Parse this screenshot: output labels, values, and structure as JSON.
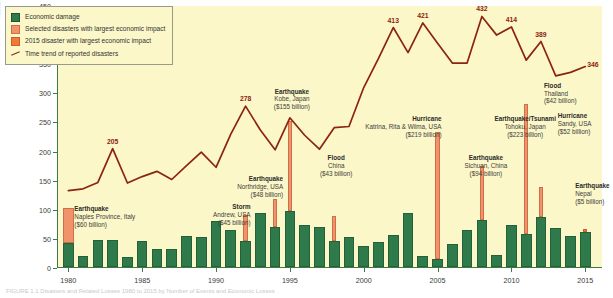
{
  "figure": {
    "caption": "FIGURE 1.1  Disasters and Related Losses 1980 to 2015 by Number of Events and Economic Losses"
  },
  "legend": {
    "items": [
      {
        "label": "Economic damage",
        "marker": "square",
        "color": "#2f7a4a"
      },
      {
        "label": "Selected disasters with largest economic impact",
        "marker": "square",
        "color": "#f0936a"
      },
      {
        "label": "2015 disaster with largest economic impact",
        "marker": "square",
        "color": "#f07838"
      },
      {
        "label": "Time trend of reported disasters",
        "marker": "line",
        "color": "#8b2410"
      }
    ]
  },
  "axes": {
    "y_label": "Number of disasters / Economic damage in 2015 US$ value (billion)",
    "y_ticks": [
      0,
      50,
      100,
      150,
      200,
      250,
      300,
      350,
      400,
      450
    ],
    "y_min": 0,
    "y_max": 450,
    "x_ticks": [
      1980,
      1985,
      1990,
      1995,
      2000,
      2005,
      2010,
      2015
    ],
    "x_min": 1979.3,
    "x_max": 2016.2
  },
  "chart_data": {
    "type": "bar",
    "title": "",
    "xlabel": "",
    "ylabel": "Number of disasters / Economic damage in 2015 US$ value (billion)",
    "ylim": [
      0,
      450
    ],
    "grid": false,
    "legend_position": "top-left",
    "categories": [
      1980,
      1981,
      1982,
      1983,
      1984,
      1985,
      1986,
      1987,
      1988,
      1989,
      1990,
      1991,
      1992,
      1993,
      1994,
      1995,
      1996,
      1997,
      1998,
      1999,
      2000,
      2001,
      2002,
      2003,
      2004,
      2005,
      2006,
      2007,
      2008,
      2009,
      2010,
      2011,
      2012,
      2013,
      2014,
      2015
    ],
    "series": [
      {
        "name": "Economic damage",
        "color": "#2f7a4a",
        "values": [
          42,
          19,
          47,
          47,
          18,
          45,
          31,
          31,
          54,
          51,
          79,
          63,
          44,
          92,
          68,
          96,
          73,
          68,
          45,
          52,
          36,
          43,
          55,
          92,
          19,
          13,
          39,
          63,
          80,
          21,
          72,
          57,
          86,
          67,
          53,
          60
        ]
      },
      {
        "name": "Selected disasters with largest economic impact",
        "color": "#f0936a",
        "values": [
          60,
          0,
          0,
          0,
          0,
          0,
          0,
          0,
          0,
          0,
          0,
          0,
          45,
          0,
          48,
          155,
          0,
          0,
          43,
          0,
          0,
          0,
          0,
          0,
          0,
          219,
          0,
          0,
          94,
          0,
          0,
          223,
          52,
          0,
          0,
          0
        ]
      },
      {
        "name": "2015 disaster with largest economic impact",
        "color": "#f07838",
        "values": [
          0,
          0,
          0,
          0,
          0,
          0,
          0,
          0,
          0,
          0,
          0,
          0,
          0,
          0,
          0,
          0,
          0,
          0,
          0,
          0,
          0,
          0,
          0,
          0,
          0,
          0,
          0,
          0,
          0,
          0,
          0,
          0,
          0,
          0,
          0,
          5
        ]
      }
    ],
    "trend": {
      "name": "Time trend of reported disasters",
      "color": "#8b2410",
      "x": [
        1980,
        1981,
        1982,
        1983,
        1984,
        1985,
        1986,
        1987,
        1988,
        1989,
        1990,
        1991,
        1992,
        1993,
        1994,
        1995,
        1996,
        1997,
        1998,
        1999,
        2000,
        2001,
        2002,
        2003,
        2004,
        2005,
        2006,
        2007,
        2008,
        2009,
        2010,
        2011,
        2012,
        2013,
        2014,
        2015
      ],
      "y": [
        133,
        136,
        147,
        205,
        146,
        157,
        166,
        152,
        176,
        199,
        173,
        230,
        278,
        237,
        203,
        258,
        228,
        204,
        241,
        243,
        310,
        360,
        413,
        370,
        421,
        386,
        352,
        352,
        432,
        400,
        414,
        357,
        389,
        330,
        336,
        346
      ]
    },
    "value_labels": [
      {
        "x": 1983,
        "y": 205,
        "text": "205"
      },
      {
        "x": 1992,
        "y": 278,
        "text": "278"
      },
      {
        "x": 2002,
        "y": 413,
        "text": "413"
      },
      {
        "x": 2004,
        "y": 421,
        "text": "421"
      },
      {
        "x": 2008,
        "y": 432,
        "text": "432"
      },
      {
        "x": 2010,
        "y": 414,
        "text": "414"
      },
      {
        "x": 2012,
        "y": 389,
        "text": "389"
      },
      {
        "x": 2015,
        "y": 346,
        "text": "346"
      }
    ],
    "annotations": [
      {
        "title": "Earthquake",
        "line2": "Naples Province, Italy",
        "line3": "($60 billion)",
        "year": 1980,
        "value": 60
      },
      {
        "title": "Storm",
        "line2": "Andrew, USA",
        "line3": "($45 billion)",
        "year": 1992,
        "value": 45
      },
      {
        "title": "Earthquake",
        "line2": "Northridge, USA",
        "line3": "($48 billion)",
        "year": 1994,
        "value": 48
      },
      {
        "title": "Earthquake",
        "line2": "Kobe, Japan",
        "line3": "($155 billion)",
        "year": 1995,
        "value": 155
      },
      {
        "title": "Flood",
        "line2": "China",
        "line3": "($43 billion)",
        "year": 1998,
        "value": 43
      },
      {
        "title": "Hurricane",
        "line2": "Katrina, Rita & Wilma, USA",
        "line3": "($219 billion)",
        "year": 2005,
        "value": 219
      },
      {
        "title": "Earthquake",
        "line2": "Sichuan, China",
        "line3": "($94 billion)",
        "year": 2008,
        "value": 94
      },
      {
        "title": "Earthquake/Tsunami",
        "line2": "Tohoku, Japan",
        "line3": "($223 billion)",
        "year": 2011,
        "value": 223
      },
      {
        "title": "Flood",
        "line2": "Thailand",
        "line3": "($42 billion)",
        "year": 2011,
        "value": 42
      },
      {
        "title": "Hurricane",
        "line2": "Sandy, USA",
        "line3": "($52 billion)",
        "year": 2012,
        "value": 52
      },
      {
        "title": "Earthquake",
        "line2": "Nepal",
        "line3": "($5 billion)",
        "year": 2015,
        "value": 5
      }
    ]
  }
}
